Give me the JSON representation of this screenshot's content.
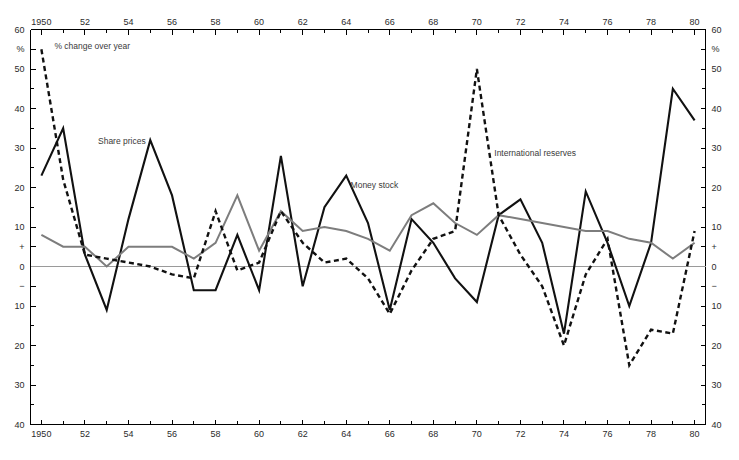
{
  "chart_data": {
    "type": "line",
    "title": "",
    "subtitle": "% change over year",
    "xlabel": "",
    "ylabel": "%",
    "xlim": [
      1949.5,
      1980.5
    ],
    "ylim": [
      -40,
      60
    ],
    "grid": false,
    "legend_position": "inline-annotations",
    "x": [
      1950,
      1951,
      1952,
      1953,
      1954,
      1955,
      1956,
      1957,
      1958,
      1959,
      1960,
      1961,
      1962,
      1963,
      1964,
      1965,
      1966,
      1967,
      1968,
      1969,
      1970,
      1971,
      1972,
      1973,
      1974,
      1975,
      1976,
      1977,
      1978,
      1979,
      1980
    ],
    "x_tick_labels": [
      "1950",
      "",
      "52",
      "",
      "54",
      "",
      "56",
      "",
      "58",
      "",
      "60",
      "",
      "62",
      "",
      "64",
      "",
      "66",
      "",
      "68",
      "",
      "70",
      "",
      "72",
      "",
      "74",
      "",
      "76",
      "",
      "78",
      "",
      "80"
    ],
    "y_tick_values": [
      60,
      55,
      50,
      40,
      30,
      20,
      10,
      5,
      0,
      -5,
      -10,
      -20,
      -30,
      -40
    ],
    "y_tick_labels": [
      "60",
      "%",
      "50",
      "40",
      "30",
      "20",
      "10",
      "+",
      "0",
      "−",
      "10",
      "20",
      "30",
      "40"
    ],
    "series": [
      {
        "name": "Share prices",
        "style": "solid-black",
        "color": "#111111",
        "label_x": 1952.6,
        "label_y": 31,
        "values": [
          23,
          35,
          3,
          -11,
          12,
          32,
          18,
          -6,
          -6,
          8,
          -6,
          28,
          -5,
          15,
          23,
          11,
          -11,
          12,
          6,
          -3,
          -9,
          13,
          17,
          6,
          -17,
          19,
          6,
          -10,
          6,
          45,
          37
        ]
      },
      {
        "name": "Money stock",
        "style": "solid-grey",
        "color": "#7d7d7d",
        "label_x": 1964.2,
        "label_y": 20,
        "values": [
          8,
          5,
          5,
          0,
          5,
          5,
          5,
          2,
          6,
          18,
          4,
          14,
          9,
          10,
          9,
          7,
          4,
          13,
          16,
          11,
          8,
          13,
          12,
          11,
          10,
          9,
          9,
          7,
          6,
          2,
          6
        ]
      },
      {
        "name": "International reserves",
        "style": "dashed-black",
        "color": "#111111",
        "label_x": 1970.8,
        "label_y": 28,
        "values": [
          55,
          22,
          3,
          2,
          1,
          0,
          -2,
          -3,
          14,
          -1,
          1,
          14,
          6,
          1,
          2,
          -3,
          -12,
          -1,
          7,
          9,
          50,
          13,
          3,
          -5,
          -20,
          -2,
          7,
          -25,
          -16,
          -17,
          9
        ]
      }
    ],
    "annotations": [
      {
        "name": "units-note",
        "text": "% change over year",
        "x": 1950.6,
        "y": 55
      }
    ]
  },
  "axes": {
    "top_labels": [
      "1950",
      "52",
      "54",
      "56",
      "58",
      "60",
      "62",
      "64",
      "66",
      "68",
      "70",
      "72",
      "74",
      "76",
      "78",
      "80"
    ],
    "bottom_labels": [
      "1950",
      "52",
      "54",
      "56",
      "58",
      "60",
      "62",
      "64",
      "66",
      "68",
      "70",
      "72",
      "74",
      "76",
      "78",
      "80"
    ],
    "left_corner_top": "60",
    "left_corner_bottom": "40",
    "right_corner_top": "60",
    "right_corner_bottom": "40",
    "unit_symbol": "%"
  }
}
